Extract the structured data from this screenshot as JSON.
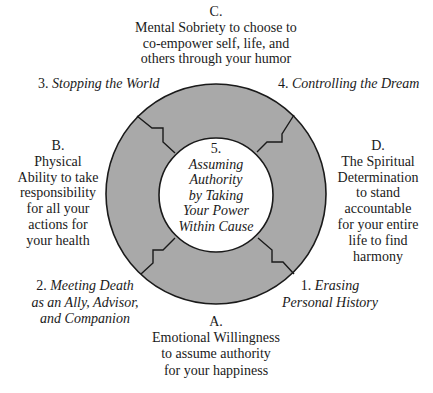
{
  "diagram": {
    "colors": {
      "ring_fill": "#a9a9a9",
      "stroke": "#1a1a1a",
      "inner_fill": "#ffffff",
      "background": "#ffffff",
      "text": "#1a1a1a"
    },
    "geometry": {
      "outer_circle": {
        "cx": 216,
        "cy": 194,
        "r": 110
      },
      "inner_circle": {
        "cx": 216,
        "cy": 195,
        "r": 57
      }
    },
    "center": {
      "number": "5.",
      "lines": [
        "Assuming",
        "Authority",
        "by Taking",
        "Your Power",
        "Within Cause"
      ]
    },
    "stages": [
      {
        "number": "1.",
        "lines": [
          "Erasing",
          "Personal History"
        ]
      },
      {
        "number": "2.",
        "lines": [
          "Meeting Death",
          "as an Ally, Advisor,",
          "and Companion"
        ]
      },
      {
        "number": "3.",
        "lines": [
          "Stopping the World"
        ]
      },
      {
        "number": "4.",
        "lines": [
          "Controlling the Dream"
        ]
      }
    ],
    "qualities": {
      "A": {
        "letter": "A.",
        "lines": [
          "Emotional Willingness",
          "to assume authority",
          "for your happiness"
        ]
      },
      "B": {
        "letter": "B.",
        "lines": [
          "Physical",
          "Ability to take",
          "responsibility",
          "for all your",
          "actions for",
          "your health"
        ]
      },
      "C": {
        "letter": "C.",
        "lines": [
          "Mental Sobriety to choose to",
          "co-empower self, life, and",
          "others through your humor"
        ]
      },
      "D": {
        "letter": "D.",
        "lines": [
          "The Spiritual",
          "Determination",
          "to stand",
          "accountable",
          "for your entire",
          "life to find",
          "harmony"
        ]
      }
    }
  }
}
